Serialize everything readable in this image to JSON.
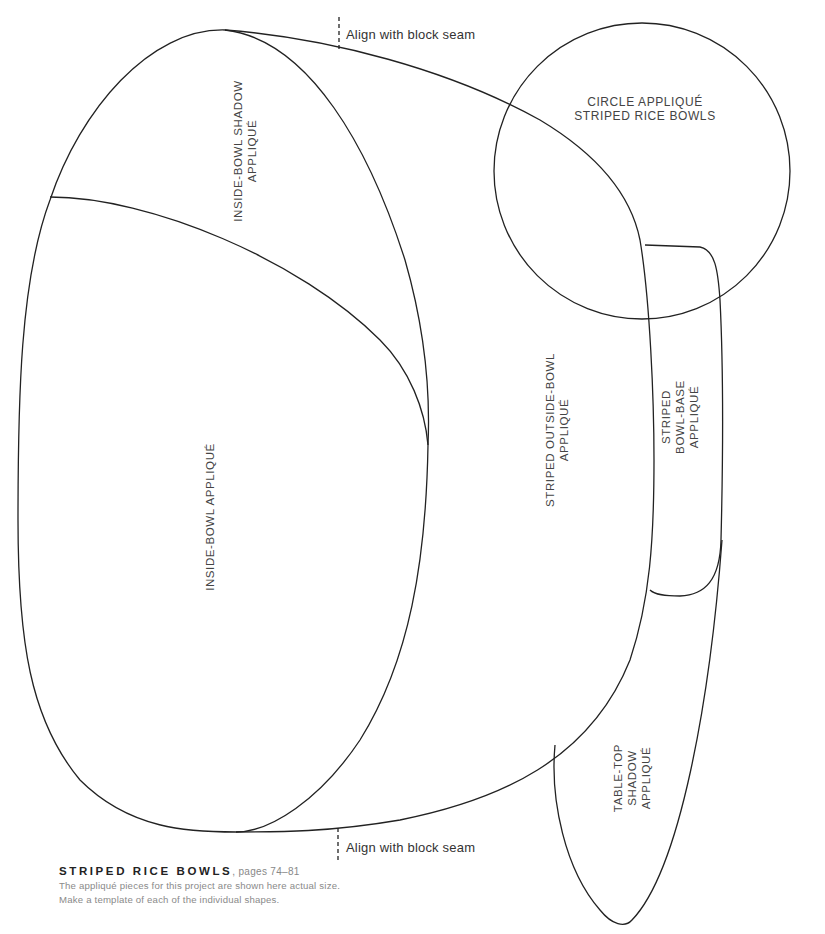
{
  "pattern": {
    "shapes": [
      {
        "id": "inside-bowl-shadow",
        "label_lines": [
          "INSIDE-BOWL SHADOW",
          "APPLIQUÉ"
        ]
      },
      {
        "id": "inside-bowl",
        "label_lines": [
          "INSIDE-BOWL APPLIQUÉ"
        ]
      },
      {
        "id": "striped-outside-bowl",
        "label_lines": [
          "STRIPED OUTSIDE-BOWL",
          "APPLIQUÉ"
        ]
      },
      {
        "id": "circle",
        "label_lines": [
          "CIRCLE APPLIQUÉ",
          "STRIPED RICE BOWLS"
        ]
      },
      {
        "id": "striped-bowl-base",
        "label_lines": [
          "STRIPED",
          "BOWL-BASE",
          "APPLIQUÉ"
        ]
      },
      {
        "id": "table-top-shadow",
        "label_lines": [
          "TABLE-TOP",
          "SHADOW",
          "APPLIQUÉ"
        ]
      }
    ],
    "align_top": "Align with block seam",
    "align_bottom": "Align with block seam",
    "stroke_color": "#222222"
  },
  "caption": {
    "title": "STRIPED RICE BOWLS",
    "pages": ", pages 74–81",
    "line1": "The appliqué pieces for this project are shown here actual size.",
    "line2": "Make a template of each of the individual shapes."
  }
}
